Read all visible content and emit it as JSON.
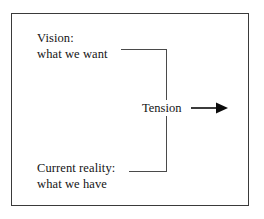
{
  "diagram": {
    "frame": {
      "border_color": "#3a3a3a"
    },
    "nodes": {
      "vision": {
        "line1": "Vision:",
        "line2": "what we want"
      },
      "current_reality": {
        "line1": "Current reality:",
        "line2": "what we have"
      },
      "tension": {
        "label": "Tension"
      }
    },
    "connectors": {
      "bracket_color": "#4a4a4a",
      "arrow": {
        "name": "right-arrow-icon",
        "color": "#0b0b0b",
        "direction": "right"
      }
    }
  }
}
